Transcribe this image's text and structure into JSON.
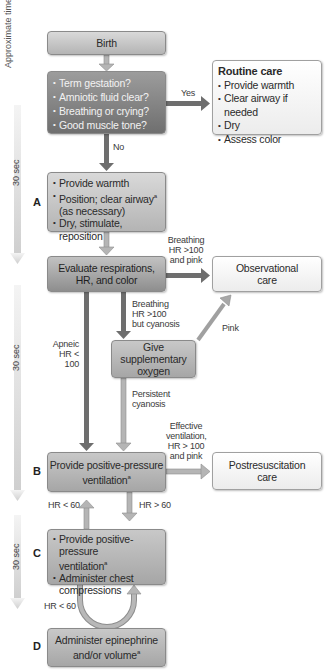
{
  "timeline": {
    "title": "Approximate time",
    "segments": [
      "30 sec",
      "30 sec",
      "30 sec"
    ]
  },
  "steps": {
    "a": "A",
    "b": "B",
    "c": "C",
    "d": "D"
  },
  "boxes": {
    "birth": "Birth",
    "assessment": {
      "items": [
        "Term gestation?",
        "Amniotic fluid clear?",
        "Breathing or crying?",
        "Good muscle tone?"
      ]
    },
    "routine_care": {
      "title": "Routine care",
      "items": [
        "Provide warmth",
        "Clear airway if needed",
        "Dry",
        "Assess color"
      ]
    },
    "step_a": {
      "items": [
        "Provide warmth",
        "Position; clear airway",
        "(as necessary)",
        "Dry, stimulate, reposition"
      ],
      "superscript": "a"
    },
    "evaluate": {
      "line1": "Evaluate respirations,",
      "line2": "HR, and color"
    },
    "observational_care": {
      "line1": "Observational",
      "line2": "care"
    },
    "supplementary_oxygen": {
      "line1": "Give supplementary",
      "line2": "oxygen"
    },
    "step_b": {
      "line1": "Provide positive-pressure",
      "line2": "ventilation",
      "superscript": "a"
    },
    "postresuscitation": {
      "line1": "Postresuscitation",
      "line2": "care"
    },
    "step_c": {
      "item1_line1": "Provide positive-pressure",
      "item1_line2": "ventilation",
      "item2_line1": "Administer chest",
      "item2_line2": "compressions",
      "superscript": "a"
    },
    "step_d": {
      "line1": "Administer epinephrine",
      "line2": "and/or volume",
      "superscript": "a"
    }
  },
  "edges": {
    "yes": "Yes",
    "no": "No",
    "breathing_pink": [
      "Breathing",
      "HR >100",
      "and pink"
    ],
    "breathing_cyanosis": [
      "Breathing",
      "HR >100",
      "but cyanosis"
    ],
    "pink": "Pink",
    "apneic": [
      "Apneic",
      "HR < 100"
    ],
    "persistent_cyanosis": [
      "Persistent",
      "cyanosis"
    ],
    "effective_ventilation": [
      "Effective",
      "ventilation,",
      "HR > 100",
      "and pink"
    ],
    "hr_lt_60_up": "HR < 60",
    "hr_gt_60": "HR > 60",
    "hr_lt_60_loop": "HR < 60"
  },
  "colors": {
    "arrow_dark": "#6e6e6e",
    "arrow_light": "#a8a8a8",
    "timeline": "#dcdcdc"
  }
}
